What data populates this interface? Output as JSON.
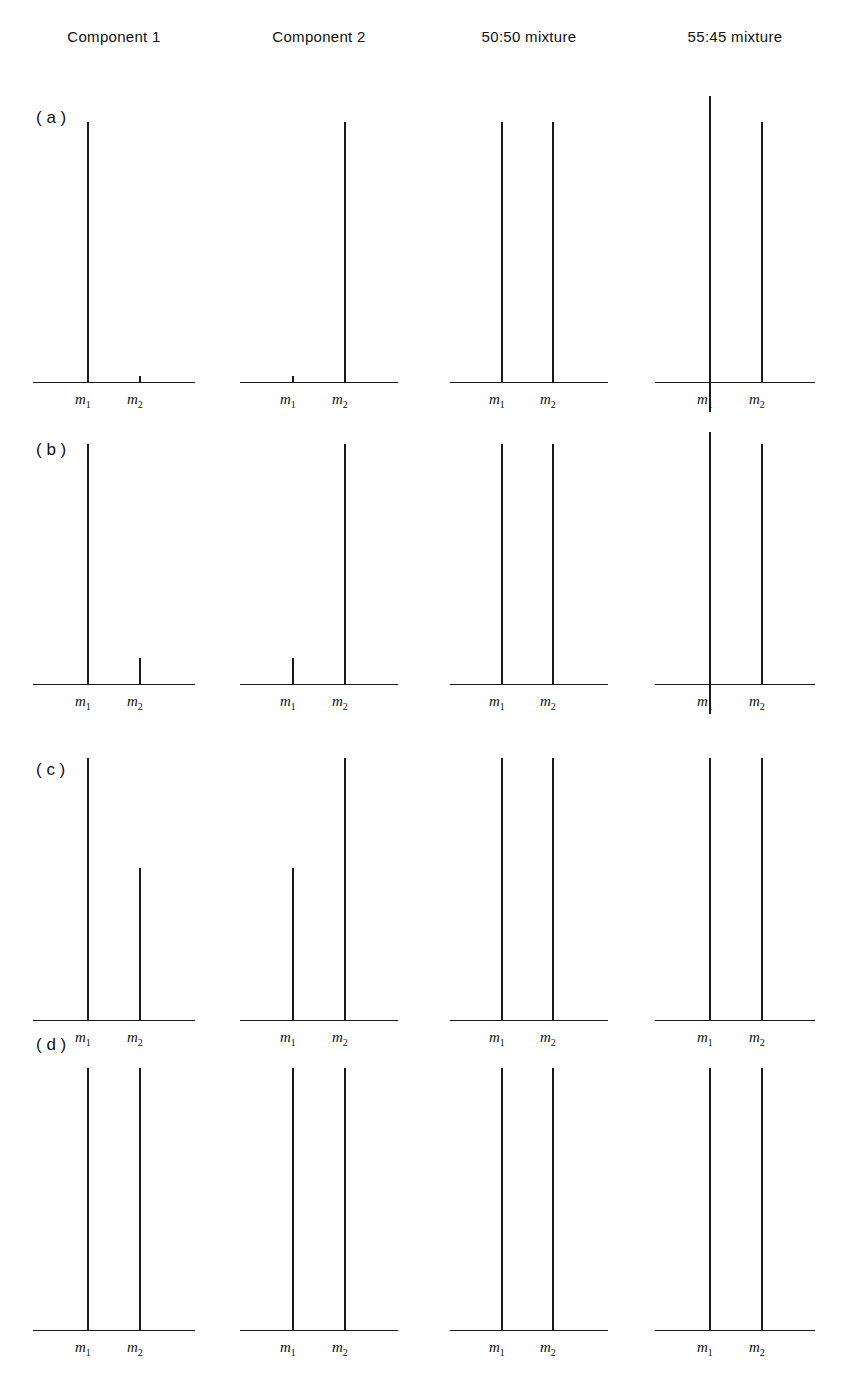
{
  "figure": {
    "column_headers": [
      {
        "label": "Component 1"
      },
      {
        "label": "Component 2"
      },
      {
        "label": "50:50 mixture"
      },
      {
        "label": "55:45 mixture"
      }
    ],
    "row_labels": [
      {
        "label": "( a )"
      },
      {
        "label": "( b )"
      },
      {
        "label": "( c )"
      },
      {
        "label": "( d )"
      }
    ],
    "axis_tick_labels": {
      "m1": "m",
      "m1_sub": "1",
      "m2": "m",
      "m2_sub": "2"
    },
    "line_color": "#1a1a1a",
    "background_color": "#ffffff"
  },
  "chart_data": {
    "type": "bar",
    "title": "",
    "subtitle": "",
    "xlabel": "",
    "ylabel": "",
    "grid": false,
    "legend": "none",
    "categories": [
      "m1",
      "m2"
    ],
    "column_names": [
      "Component 1",
      "Component 2",
      "50:50 mixture",
      "55:45 mixture"
    ],
    "row_names": [
      "( a )",
      "( b )",
      "( c )",
      "( d )"
    ],
    "ylim": [
      0,
      110
    ],
    "panels": [
      {
        "row": "( a )",
        "column": "Component 1",
        "values": [
          100,
          0
        ]
      },
      {
        "row": "( a )",
        "column": "Component 2",
        "values": [
          0,
          100
        ]
      },
      {
        "row": "( a )",
        "column": "50:50 mixture",
        "values": [
          100,
          100
        ]
      },
      {
        "row": "( a )",
        "column": "55:45 mixture",
        "values": [
          110,
          100
        ]
      },
      {
        "row": "( b )",
        "column": "Component 1",
        "values": [
          100,
          11
        ]
      },
      {
        "row": "( b )",
        "column": "Component 2",
        "values": [
          11,
          100
        ]
      },
      {
        "row": "( b )",
        "column": "50:50 mixture",
        "values": [
          100,
          100
        ]
      },
      {
        "row": "( b )",
        "column": "55:45 mixture",
        "values": [
          105,
          100
        ]
      },
      {
        "row": "( c )",
        "column": "Component 1",
        "values": [
          100,
          58
        ]
      },
      {
        "row": "( c )",
        "column": "Component 2",
        "values": [
          58,
          100
        ]
      },
      {
        "row": "( c )",
        "column": "50:50 mixture",
        "values": [
          100,
          100
        ]
      },
      {
        "row": "( c )",
        "column": "55:45 mixture",
        "values": [
          100,
          100
        ]
      },
      {
        "row": "( d )",
        "column": "Component 1",
        "values": [
          100,
          100
        ]
      },
      {
        "row": "( d )",
        "column": "Component 2",
        "values": [
          100,
          100
        ]
      },
      {
        "row": "( d )",
        "column": "50:50 mixture",
        "values": [
          100,
          100
        ]
      },
      {
        "row": "( d )",
        "column": "55:45 mixture",
        "values": [
          100,
          100
        ]
      }
    ]
  },
  "layout": {
    "columns": [
      {
        "axis_left": 33,
        "axis_width": 162,
        "m1_x": 88,
        "m2_x": 140
      },
      {
        "axis_left": 240,
        "axis_width": 158,
        "m1_x": 293,
        "m2_x": 345
      },
      {
        "axis_left": 450,
        "axis_width": 158,
        "m1_x": 502,
        "m2_x": 553
      },
      {
        "axis_left": 655,
        "axis_width": 160,
        "m1_x": 710,
        "m2_x": 762
      }
    ],
    "header_y": 28,
    "rows": [
      {
        "baseline_y": 382,
        "peak_full_height": 260,
        "label_y": 108
      },
      {
        "baseline_y": 684,
        "peak_full_height": 240,
        "label_y": 440
      },
      {
        "baseline_y": 1020,
        "peak_full_height": 262,
        "label_y": 760
      },
      {
        "baseline_y": 1330,
        "peak_full_height": 262,
        "label_y": 1035
      }
    ]
  }
}
